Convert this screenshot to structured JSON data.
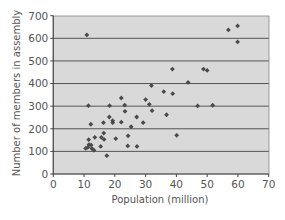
{
  "chart_data": {
    "type": "scatter",
    "title": "",
    "xlabel": "Population (million)",
    "ylabel": "Number of members in assembly",
    "xlim": [
      0,
      70
    ],
    "ylim": [
      0,
      700
    ],
    "xticks": [
      0,
      10,
      20,
      30,
      40,
      50,
      60,
      70
    ],
    "yticks": [
      0,
      100,
      200,
      300,
      400,
      500,
      600,
      700
    ],
    "grid": {
      "horizontal": true,
      "vertical": false
    },
    "legend": null,
    "colors": {
      "plot_background": "#d9d9d9",
      "gridline": "#555555",
      "marker": "#4a4a4a",
      "axis": "#444444",
      "text": "#555555"
    },
    "points": [
      {
        "x": 10.9,
        "y": 615
      },
      {
        "x": 56.9,
        "y": 637
      },
      {
        "x": 59.9,
        "y": 655
      },
      {
        "x": 59.9,
        "y": 584
      },
      {
        "x": 38.7,
        "y": 464
      },
      {
        "x": 48.8,
        "y": 464
      },
      {
        "x": 50.0,
        "y": 458
      },
      {
        "x": 43.8,
        "y": 405
      },
      {
        "x": 31.9,
        "y": 391
      },
      {
        "x": 35.9,
        "y": 364
      },
      {
        "x": 38.8,
        "y": 355
      },
      {
        "x": 22.1,
        "y": 336
      },
      {
        "x": 30.0,
        "y": 329
      },
      {
        "x": 31.2,
        "y": 308
      },
      {
        "x": 23.2,
        "y": 305
      },
      {
        "x": 11.4,
        "y": 302
      },
      {
        "x": 18.3,
        "y": 302
      },
      {
        "x": 46.9,
        "y": 301
      },
      {
        "x": 51.8,
        "y": 304
      },
      {
        "x": 32.1,
        "y": 280
      },
      {
        "x": 23.3,
        "y": 277
      },
      {
        "x": 36.8,
        "y": 262
      },
      {
        "x": 18.2,
        "y": 252
      },
      {
        "x": 27.1,
        "y": 252
      },
      {
        "x": 19.3,
        "y": 236
      },
      {
        "x": 19.3,
        "y": 227
      },
      {
        "x": 16.3,
        "y": 227
      },
      {
        "x": 22.1,
        "y": 229
      },
      {
        "x": 29.2,
        "y": 227
      },
      {
        "x": 12.2,
        "y": 220
      },
      {
        "x": 25.3,
        "y": 209
      },
      {
        "x": 16.4,
        "y": 181
      },
      {
        "x": 40.1,
        "y": 171
      },
      {
        "x": 24.3,
        "y": 169
      },
      {
        "x": 13.5,
        "y": 162
      },
      {
        "x": 15.6,
        "y": 162
      },
      {
        "x": 16.5,
        "y": 153
      },
      {
        "x": 11.5,
        "y": 152
      },
      {
        "x": 20.3,
        "y": 156
      },
      {
        "x": 15.4,
        "y": 122
      },
      {
        "x": 24.2,
        "y": 124
      },
      {
        "x": 27.2,
        "y": 122
      },
      {
        "x": 11.6,
        "y": 130
      },
      {
        "x": 12.3,
        "y": 128
      },
      {
        "x": 10.5,
        "y": 113
      },
      {
        "x": 11.2,
        "y": 118
      },
      {
        "x": 12.5,
        "y": 113
      },
      {
        "x": 13.2,
        "y": 105
      },
      {
        "x": 17.4,
        "y": 81
      }
    ]
  }
}
